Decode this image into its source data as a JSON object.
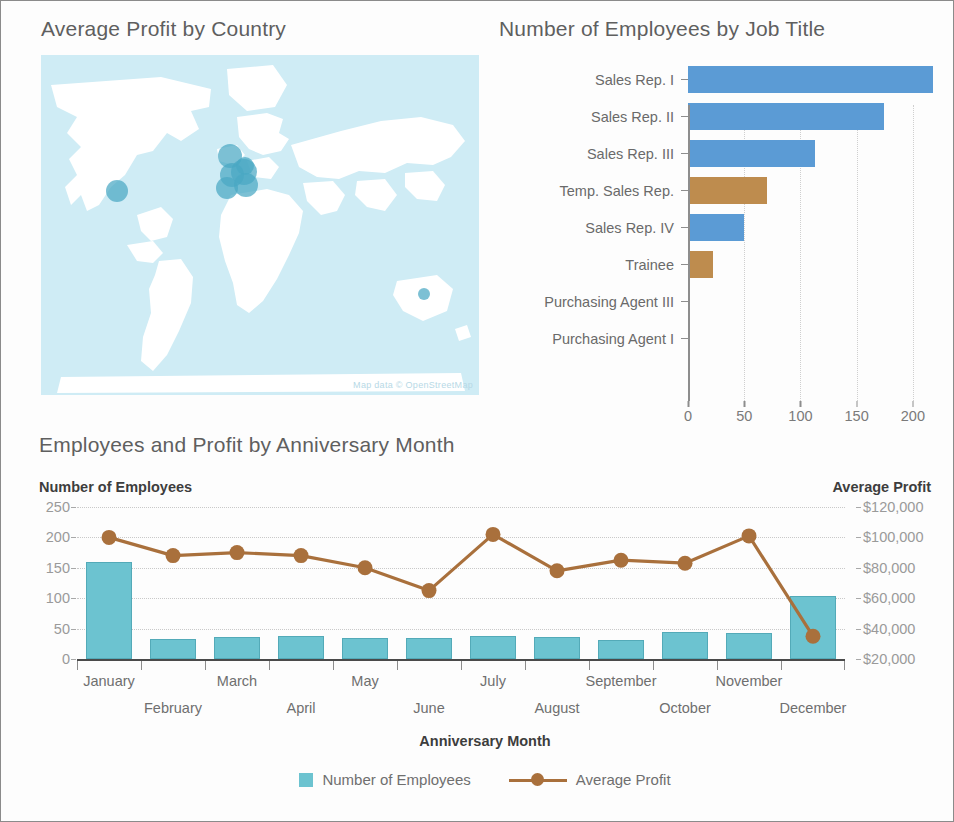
{
  "map_panel": {
    "title": "Average Profit by Country",
    "attribution": "Map data © OpenStreetMap",
    "bubble_color": "#4aa8c4",
    "land_color": "#ffffff",
    "water_color": "#cfecf5",
    "bubbles": [
      {
        "x": 76,
        "y": 136,
        "r": 11
      },
      {
        "x": 189,
        "y": 101,
        "r": 12
      },
      {
        "x": 204,
        "y": 111,
        "r": 9
      },
      {
        "x": 203,
        "y": 117,
        "r": 13
      },
      {
        "x": 191,
        "y": 120,
        "r": 12
      },
      {
        "x": 186,
        "y": 133,
        "r": 11
      },
      {
        "x": 205,
        "y": 130,
        "r": 12
      },
      {
        "x": 383,
        "y": 239,
        "r": 6
      }
    ]
  },
  "bar_panel": {
    "title": "Number of Employees by Job Title",
    "colors": {
      "blue": "#5b9bd5",
      "brown": "#be8c4e"
    },
    "chart_data": {
      "type": "bar",
      "orientation": "horizontal",
      "title": "Number of Employees by Job Title",
      "xlabel": "",
      "ylabel": "",
      "xlim": [
        0,
        225
      ],
      "xticks": [
        0,
        50,
        100,
        150,
        200
      ],
      "xtick_labels": [
        "0",
        "50",
        "100",
        "150",
        "200"
      ],
      "grid": true,
      "categories": [
        "Sales Rep. I",
        "Sales Rep. II",
        "Sales Rep. III",
        "Temp. Sales Rep.",
        "Sales Rep. IV",
        "Trainee",
        "Purchasing Agent III",
        "Purchasing Agent I"
      ],
      "values": [
        218,
        174,
        113,
        70,
        50,
        22,
        1,
        1
      ],
      "colors": [
        "blue",
        "blue",
        "blue",
        "brown",
        "blue",
        "brown",
        "blue",
        "blue"
      ]
    }
  },
  "combo_panel": {
    "title": "Employees and Profit by Anniversary Month",
    "left_axis_title": "Number of Employees",
    "right_axis_title": "Average Profit",
    "xaxis_title": "Anniversary Month",
    "legend": [
      {
        "label": "Number of Employees",
        "marker": "square",
        "color": "#6cc3d0"
      },
      {
        "label": "Average Profit",
        "marker": "line-dot",
        "color": "#a9703c"
      }
    ],
    "chart_data": {
      "type": "bar",
      "combo": true,
      "title": "Employees and Profit by Anniversary Month",
      "xlabel": "Anniversary Month",
      "categories": [
        "January",
        "February",
        "March",
        "April",
        "May",
        "June",
        "July",
        "August",
        "September",
        "October",
        "November",
        "December"
      ],
      "left_axis": {
        "label": "Number of Employees",
        "ylim": [
          0,
          250
        ],
        "ticks": [
          0,
          50,
          100,
          150,
          200,
          250
        ],
        "tick_labels": [
          "0",
          "50",
          "100",
          "150",
          "200",
          "250"
        ]
      },
      "right_axis": {
        "label": "Average Profit",
        "ylim": [
          20000,
          120000
        ],
        "ticks": [
          20000,
          40000,
          60000,
          80000,
          100000,
          120000
        ],
        "tick_labels": [
          "$20,000",
          "$40,000",
          "$60,000",
          "$80,000",
          "$100,000",
          "$120,000"
        ]
      },
      "series": [
        {
          "name": "Number of Employees",
          "type": "bar",
          "axis": "left",
          "color": "#6cc3d0",
          "values": [
            160,
            33,
            36,
            38,
            34,
            35,
            38,
            36,
            31,
            44,
            43,
            103
          ]
        },
        {
          "name": "Average Profit",
          "type": "line",
          "axis": "right",
          "color": "#a9703c",
          "values": [
            100000,
            88000,
            90000,
            88000,
            80000,
            65000,
            102000,
            78000,
            85000,
            83000,
            101000,
            35000
          ]
        }
      ],
      "grid": true,
      "legend_position": "bottom"
    }
  }
}
